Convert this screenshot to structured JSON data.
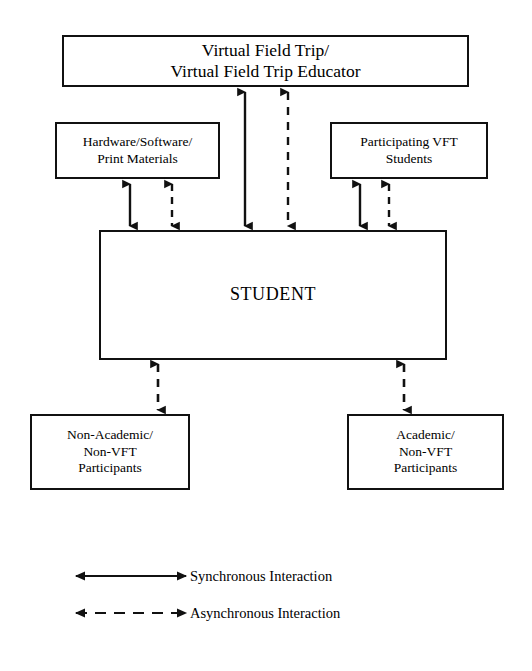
{
  "diagram": {
    "nodes": {
      "vft": {
        "label": "Virtual Field Trip/\nVirtual Field Trip Educator"
      },
      "hardware": {
        "label": "Hardware/Software/\nPrint Materials"
      },
      "vft_students": {
        "label": "Participating VFT\nStudents"
      },
      "student": {
        "label": "STUDENT"
      },
      "non_academic": {
        "label": "Non-Academic/\nNon-VFT\nParticipants"
      },
      "academic": {
        "label": "Academic/\nNon-VFT\nParticipants"
      }
    },
    "legend": {
      "synchronous": {
        "label": "Synchronous Interaction",
        "style": "solid",
        "arrow": "double-headed"
      },
      "asynchronous": {
        "label": "Asynchronous Interaction",
        "style": "dashed",
        "arrow": "double-headed"
      }
    },
    "connectors": [
      {
        "from": "vft",
        "to": "student",
        "style": "solid",
        "arrow": "double-headed",
        "orientation": "vertical"
      },
      {
        "from": "vft",
        "to": "student",
        "style": "dashed",
        "arrow": "double-headed",
        "orientation": "vertical"
      },
      {
        "from": "hardware",
        "to": "student",
        "style": "solid",
        "arrow": "double-headed",
        "orientation": "vertical"
      },
      {
        "from": "hardware",
        "to": "student",
        "style": "dashed",
        "arrow": "double-headed",
        "orientation": "vertical"
      },
      {
        "from": "vft_students",
        "to": "student",
        "style": "solid",
        "arrow": "double-headed",
        "orientation": "vertical"
      },
      {
        "from": "vft_students",
        "to": "student",
        "style": "dashed",
        "arrow": "double-headed",
        "orientation": "vertical"
      },
      {
        "from": "student",
        "to": "non_academic",
        "style": "dashed",
        "arrow": "double-headed",
        "orientation": "vertical"
      },
      {
        "from": "student",
        "to": "academic",
        "style": "dashed",
        "arrow": "double-headed",
        "orientation": "vertical"
      },
      {
        "from": "student-inner-left",
        "to": "student",
        "style": "solid",
        "arrow": "single-right",
        "orientation": "horizontal"
      },
      {
        "from": "student-inner-right",
        "to": "student",
        "style": "dashed",
        "arrow": "single-left",
        "orientation": "horizontal"
      }
    ],
    "colors": {
      "stroke": "#111111",
      "background": "#ffffff",
      "text": "#000000"
    }
  }
}
